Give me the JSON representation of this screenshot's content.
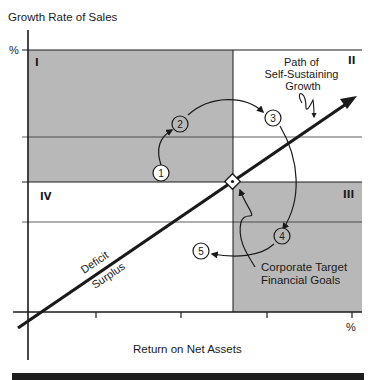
{
  "diagram": {
    "y_axis_label": "Growth Rate of Sales",
    "x_axis_label": "Return on Net Assets",
    "y_axis_unit": "%",
    "x_axis_unit": "%",
    "quadrants": {
      "q1": "I",
      "q2": "II",
      "q3": "III",
      "q4": "IV"
    },
    "path_label_line1": "Path of",
    "path_label_line2": "Self-Sustaining",
    "path_label_line3": "Growth",
    "deficit_label": "Deficit",
    "surplus_label": "Surplus",
    "target_label_line1": "Corporate Target",
    "target_label_line2": "Financial Goals",
    "steps": [
      "1",
      "2",
      "3",
      "4",
      "5"
    ],
    "colors": {
      "shaded": "#b8b8b8",
      "line": "#1a1a1a",
      "background": "#ffffff",
      "footer_bar": "#1e1e1e"
    }
  }
}
